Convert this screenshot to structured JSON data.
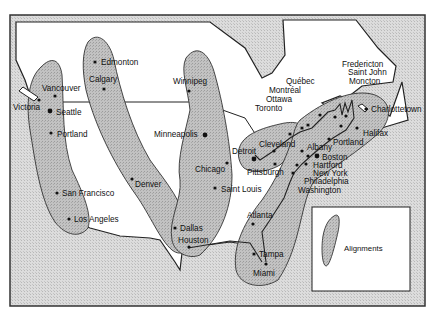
{
  "map": {
    "legend": {
      "label": "Alignments"
    },
    "colors": {
      "sea": "#d4d4d4",
      "land": "#ffffff",
      "alignment": "#b9b9b9",
      "outline": "#222222"
    },
    "cities": [
      {
        "name": "Victoria",
        "x": 39,
        "y": 100,
        "lx": 13,
        "ly": 110
      },
      {
        "name": "Vancouver",
        "x": 55,
        "y": 96,
        "lx": 42,
        "ly": 91
      },
      {
        "name": "Seattle",
        "x": 50,
        "y": 111,
        "lx": 56,
        "ly": 115
      },
      {
        "name": "Portland",
        "x": 51,
        "y": 133,
        "lx": 57,
        "ly": 137
      },
      {
        "name": "San Francisco",
        "x": 57,
        "y": 193,
        "lx": 62,
        "ly": 196
      },
      {
        "name": "Los Angeles",
        "x": 69,
        "y": 219,
        "lx": 74,
        "ly": 222
      },
      {
        "name": "Edmonton",
        "x": 95,
        "y": 62,
        "lx": 101,
        "ly": 65
      },
      {
        "name": "Calgary",
        "x": 104,
        "y": 89,
        "lx": 89,
        "ly": 82
      },
      {
        "name": "Denver",
        "x": 132,
        "y": 179,
        "lx": 135,
        "ly": 187
      },
      {
        "name": "Dallas",
        "x": 175,
        "y": 228,
        "lx": 180,
        "ly": 231
      },
      {
        "name": "Houston",
        "x": 189,
        "y": 247,
        "lx": 178,
        "ly": 243
      },
      {
        "name": "Winnipeg",
        "x": 189,
        "y": 91,
        "lx": 173,
        "ly": 84
      },
      {
        "name": "Minneapolis",
        "x": 205,
        "y": 135,
        "lx": 154,
        "ly": 137
      },
      {
        "name": "Chicago",
        "x": 227,
        "y": 163,
        "lx": 195,
        "ly": 172
      },
      {
        "name": "Saint Louis",
        "x": 215,
        "y": 188,
        "lx": 221,
        "ly": 192
      },
      {
        "name": "Detroit",
        "x": 254,
        "y": 159,
        "lx": 232,
        "ly": 154
      },
      {
        "name": "Cleveland",
        "x": 274,
        "y": 151,
        "lx": 259,
        "ly": 147
      },
      {
        "name": "Pittsburgh",
        "x": 275,
        "y": 164,
        "lx": 247,
        "ly": 175
      },
      {
        "name": "Toronto",
        "x": 290,
        "y": 134,
        "lx": 255,
        "ly": 111
      },
      {
        "name": "Ottawa",
        "x": 302,
        "y": 128,
        "lx": 266,
        "ly": 102
      },
      {
        "name": "Montréal",
        "x": 308,
        "y": 125,
        "lx": 269,
        "ly": 93
      },
      {
        "name": "Québec",
        "x": 320,
        "y": 115,
        "lx": 286,
        "ly": 84
      },
      {
        "name": "Fredericton",
        "x": 335,
        "y": 117,
        "lx": 342,
        "ly": 67
      },
      {
        "name": "Saint John",
        "x": 341,
        "y": 126,
        "lx": 348,
        "ly": 75
      },
      {
        "name": "Moncton",
        "x": 346,
        "y": 116,
        "lx": 349,
        "ly": 84
      },
      {
        "name": "Charlottetown",
        "x": 366,
        "y": 109,
        "lx": 371,
        "ly": 112
      },
      {
        "name": "Halifax",
        "x": 357,
        "y": 128,
        "lx": 363,
        "ly": 136
      },
      {
        "name": "Portland",
        "x": 329,
        "y": 139,
        "lx": 333,
        "ly": 145
      },
      {
        "name": "Albany",
        "x": 302,
        "y": 151,
        "lx": 307,
        "ly": 150
      },
      {
        "name": "Boston",
        "x": 317,
        "y": 156,
        "lx": 322,
        "ly": 160
      },
      {
        "name": "Hartford",
        "x": 308,
        "y": 156,
        "lx": 313,
        "ly": 168
      },
      {
        "name": "New York",
        "x": 306,
        "y": 164,
        "lx": 313,
        "ly": 176
      },
      {
        "name": "Philadelphia",
        "x": 297,
        "y": 165,
        "lx": 304,
        "ly": 184
      },
      {
        "name": "Washington",
        "x": 293,
        "y": 173,
        "lx": 298,
        "ly": 193
      },
      {
        "name": "Atlanta",
        "x": 253,
        "y": 224,
        "lx": 247,
        "ly": 218
      },
      {
        "name": "Tampa",
        "x": 254,
        "y": 254,
        "lx": 259,
        "ly": 257
      },
      {
        "name": "Miami",
        "x": 266,
        "y": 264,
        "lx": 253,
        "ly": 276
      }
    ]
  }
}
